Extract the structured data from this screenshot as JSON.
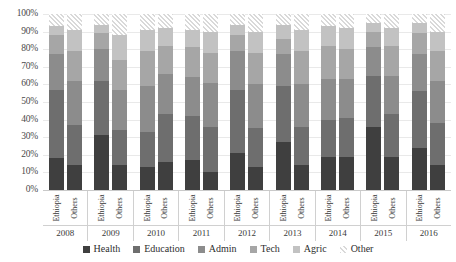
{
  "chart_data": {
    "type": "bar",
    "subtype": "100% stacked bar, grouped",
    "title": "",
    "xlabel": "",
    "ylabel": "",
    "ylim": [
      0,
      100
    ],
    "grid": true,
    "legend_position": "bottom",
    "y_ticks": [
      "100%",
      "90%",
      "80%",
      "70%",
      "60%",
      "50%",
      "40%",
      "30%",
      "20%",
      "10%",
      "0%"
    ],
    "y_tick_values": [
      100,
      90,
      80,
      70,
      60,
      50,
      40,
      30,
      20,
      10,
      0
    ],
    "categories": [
      "2008",
      "2009",
      "2010",
      "2011",
      "2012",
      "2013",
      "2014",
      "2015",
      "2016"
    ],
    "subcategories": [
      "Ethiopia",
      "Others"
    ],
    "series": [
      {
        "name": "Health",
        "color": "#3f3f3f"
      },
      {
        "name": "Education",
        "color": "#6e6e6e"
      },
      {
        "name": "Admin",
        "color": "#8c8c8c"
      },
      {
        "name": "Tech",
        "color": "#a6a6a6"
      },
      {
        "name": "Agric",
        "color": "#c2c2c2"
      },
      {
        "name": "Other",
        "color": "#d9d9d9",
        "pattern": "diagonal-hatch"
      }
    ],
    "groups": [
      {
        "year": "2008",
        "bars": [
          {
            "label": "Ethiopia",
            "values": {
              "Health": 18,
              "Education": 39,
              "Admin": 20,
              "Tech": 11,
              "Agric": 5,
              "Other": 7
            }
          },
          {
            "label": "Others",
            "values": {
              "Health": 14,
              "Education": 23,
              "Admin": 25,
              "Tech": 17,
              "Agric": 12,
              "Other": 9
            }
          }
        ]
      },
      {
        "year": "2009",
        "bars": [
          {
            "label": "Ethiopia",
            "values": {
              "Health": 31,
              "Education": 31,
              "Admin": 18,
              "Tech": 9,
              "Agric": 5,
              "Other": 6
            }
          },
          {
            "label": "Others",
            "values": {
              "Health": 14,
              "Education": 20,
              "Admin": 23,
              "Tech": 17,
              "Agric": 14,
              "Other": 12
            }
          }
        ]
      },
      {
        "year": "2010",
        "bars": [
          {
            "label": "Ethiopia",
            "values": {
              "Health": 13,
              "Education": 20,
              "Admin": 26,
              "Tech": 20,
              "Agric": 12,
              "Other": 9
            }
          },
          {
            "label": "Others",
            "values": {
              "Health": 16,
              "Education": 27,
              "Admin": 23,
              "Tech": 16,
              "Agric": 10,
              "Other": 8
            }
          }
        ]
      },
      {
        "year": "2011",
        "bars": [
          {
            "label": "Ethiopia",
            "values": {
              "Health": 17,
              "Education": 25,
              "Admin": 22,
              "Tech": 17,
              "Agric": 10,
              "Other": 9
            }
          },
          {
            "label": "Others",
            "values": {
              "Health": 10,
              "Education": 26,
              "Admin": 25,
              "Tech": 17,
              "Agric": 12,
              "Other": 10
            }
          }
        ]
      },
      {
        "year": "2012",
        "bars": [
          {
            "label": "Ethiopia",
            "values": {
              "Health": 21,
              "Education": 36,
              "Admin": 22,
              "Tech": 9,
              "Agric": 6,
              "Other": 6
            }
          },
          {
            "label": "Others",
            "values": {
              "Health": 13,
              "Education": 22,
              "Admin": 25,
              "Tech": 18,
              "Agric": 12,
              "Other": 10
            }
          }
        ]
      },
      {
        "year": "2013",
        "bars": [
          {
            "label": "Ethiopia",
            "values": {
              "Health": 27,
              "Education": 32,
              "Admin": 18,
              "Tech": 9,
              "Agric": 8,
              "Other": 6
            }
          },
          {
            "label": "Others",
            "values": {
              "Health": 14,
              "Education": 22,
              "Admin": 24,
              "Tech": 19,
              "Agric": 12,
              "Other": 9
            }
          }
        ]
      },
      {
        "year": "2014",
        "bars": [
          {
            "label": "Ethiopia",
            "values": {
              "Health": 19,
              "Education": 21,
              "Admin": 23,
              "Tech": 19,
              "Agric": 11,
              "Other": 7
            }
          },
          {
            "label": "Others",
            "values": {
              "Health": 19,
              "Education": 22,
              "Admin": 22,
              "Tech": 17,
              "Agric": 12,
              "Other": 8
            }
          }
        ]
      },
      {
        "year": "2015",
        "bars": [
          {
            "label": "Ethiopia",
            "values": {
              "Health": 36,
              "Education": 29,
              "Admin": 16,
              "Tech": 9,
              "Agric": 5,
              "Other": 5
            }
          },
          {
            "label": "Others",
            "values": {
              "Health": 19,
              "Education": 24,
              "Admin": 22,
              "Tech": 17,
              "Agric": 10,
              "Other": 8
            }
          }
        ]
      },
      {
        "year": "2016",
        "bars": [
          {
            "label": "Ethiopia",
            "values": {
              "Health": 24,
              "Education": 32,
              "Admin": 21,
              "Tech": 12,
              "Agric": 6,
              "Other": 5
            }
          },
          {
            "label": "Others",
            "values": {
              "Health": 14,
              "Education": 24,
              "Admin": 24,
              "Tech": 17,
              "Agric": 11,
              "Other": 10
            }
          }
        ]
      }
    ]
  },
  "legend": {
    "items": [
      {
        "label": "Health",
        "swatch": "health-swatch"
      },
      {
        "label": "Education",
        "swatch": "education-swatch"
      },
      {
        "label": "Admin",
        "swatch": "admin-swatch"
      },
      {
        "label": "Tech",
        "swatch": "tech-swatch"
      },
      {
        "label": "Agric",
        "swatch": "agric-swatch"
      },
      {
        "label": "Other",
        "swatch": "other-swatch"
      }
    ]
  }
}
